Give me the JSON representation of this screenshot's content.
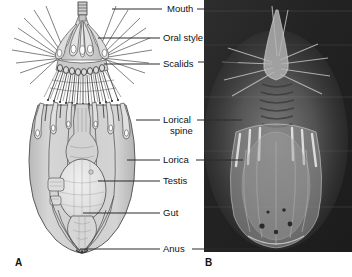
{
  "figure": {
    "background_color": "#ffffff",
    "panels": [
      {
        "letter": "A",
        "kind": "line-drawing",
        "subject": "loriciferan ventral view line drawing",
        "letter_x": 15,
        "letter_y": 266
      },
      {
        "letter": "B",
        "kind": "photomicrograph",
        "subject": "loriciferan dark-field light micrograph",
        "letter_x": 205,
        "letter_y": 266,
        "frame": {
          "x": 204,
          "y": 0,
          "width": 148,
          "height": 252,
          "background_color": "#262626"
        }
      }
    ],
    "labels": [
      {
        "id": "mouth",
        "text": "Mouth",
        "lines": [
          "Mouth"
        ],
        "x": 167,
        "y": 9,
        "leader_left_x1": 112,
        "leader_left_x2": 162,
        "leader_left_y": 9,
        "leader_right_x1": 197,
        "leader_right_x2": 232,
        "leader_right_y": 9
      },
      {
        "id": "oral-style",
        "text": "Oral style",
        "lines": [
          "Oral style"
        ],
        "x": 163,
        "y": 38,
        "leader_left_x1": 98,
        "leader_left_x2": 160,
        "leader_left_y": 38,
        "leader_right_x1": 0,
        "leader_right_x2": 0,
        "leader_right_y": 0
      },
      {
        "id": "scalids",
        "text": "Scalids",
        "lines": [
          "Scalids"
        ],
        "x": 163,
        "y": 64,
        "leader_left_x1": 104,
        "leader_left_x2": 160,
        "leader_left_y": 64,
        "leader_right_x1": 198,
        "leader_right_x2": 238,
        "leader_right_y": 62
      },
      {
        "id": "lorical-spine",
        "text": "Lorical spine",
        "lines": [
          "Lorical",
          "spine"
        ],
        "x": 163,
        "y": 120,
        "leader_left_x1": 136,
        "leader_left_x2": 160,
        "leader_left_y": 120,
        "leader_right_x1": 197,
        "leader_right_x2": 242,
        "leader_right_y": 120
      },
      {
        "id": "lorica",
        "text": "Lorica",
        "lines": [
          "Lorica"
        ],
        "x": 163,
        "y": 160,
        "leader_left_x1": 127,
        "leader_left_x2": 160,
        "leader_left_y": 160,
        "leader_right_x1": 196,
        "leader_right_x2": 243,
        "leader_right_y": 160
      },
      {
        "id": "testis",
        "text": "Testis",
        "lines": [
          "Testis"
        ],
        "x": 163,
        "y": 181,
        "leader_left_x1": 98,
        "leader_left_x2": 160,
        "leader_left_y": 181,
        "leader_right_x1": 0,
        "leader_right_x2": 0,
        "leader_right_y": 0
      },
      {
        "id": "gut",
        "text": "Gut",
        "lines": [
          "Gut"
        ],
        "x": 163,
        "y": 213,
        "leader_left_x1": 83,
        "leader_left_x2": 160,
        "leader_left_y": 213,
        "leader_right_x1": 0,
        "leader_right_x2": 0,
        "leader_right_y": 0
      },
      {
        "id": "anus",
        "text": "Anus",
        "lines": [
          "Anus"
        ],
        "x": 163,
        "y": 249,
        "leader_left_x1": 80,
        "leader_left_x2": 160,
        "leader_left_y": 249,
        "leader_right_x1": 192,
        "leader_right_x2": 280,
        "leader_right_y": 249
      }
    ]
  }
}
